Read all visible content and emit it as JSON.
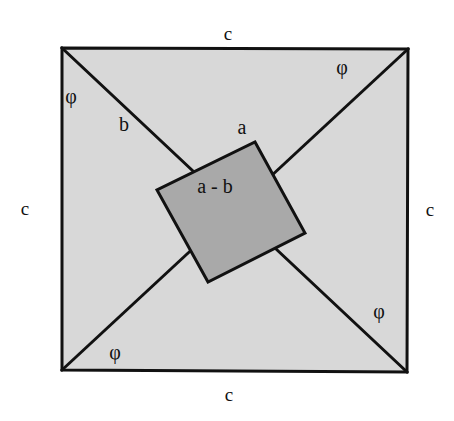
{
  "figure": {
    "type": "geometric-proof-diagram",
    "canvas": {
      "width": 454,
      "height": 421
    },
    "colors": {
      "page_background": "#ffffff",
      "outer_square_fill": "#d8d8d8",
      "inner_square_fill": "#a9a9a9",
      "stroke": "#111111",
      "text": "#111111"
    },
    "outer_square": {
      "name": "outer-square",
      "fill": "#d8d8d8",
      "stroke_width": 3,
      "points": [
        {
          "x": 62,
          "y": 48
        },
        {
          "x": 408,
          "y": 49
        },
        {
          "x": 407,
          "y": 372
        },
        {
          "x": 62,
          "y": 370
        }
      ]
    },
    "inner_square": {
      "name": "inner-square",
      "fill": "#a9a9a9",
      "stroke_width": 3,
      "points": [
        {
          "x": 255,
          "y": 142
        },
        {
          "x": 305,
          "y": 233
        },
        {
          "x": 208,
          "y": 282
        },
        {
          "x": 157,
          "y": 190
        }
      ]
    },
    "diagonals": [
      {
        "name": "diagonal-top-left-to-bottom-right",
        "x1": 62,
        "y1": 48,
        "x2": 407,
        "y2": 372,
        "stroke_width": 3
      },
      {
        "name": "diagonal-bottom-left-to-top-right",
        "x1": 62,
        "y1": 370,
        "x2": 408,
        "y2": 49,
        "stroke_width": 3
      }
    ]
  },
  "labels": {
    "sides": [
      {
        "id": "c-top",
        "text": "c",
        "x": 228,
        "y": 33,
        "name": "side-label-c-top"
      },
      {
        "id": "c-right",
        "text": "c",
        "x": 430,
        "y": 209,
        "name": "side-label-c-right"
      },
      {
        "id": "c-bottom",
        "text": "c",
        "x": 229,
        "y": 394,
        "name": "side-label-c-bottom"
      },
      {
        "id": "c-left",
        "text": "c",
        "x": 25,
        "y": 208,
        "name": "side-label-c-left"
      }
    ],
    "angles": [
      {
        "id": "phi-top-left",
        "text": "φ",
        "x": 71,
        "y": 96,
        "name": "angle-label-phi-top-left"
      },
      {
        "id": "phi-top-right",
        "text": "φ",
        "x": 342,
        "y": 67,
        "name": "angle-label-phi-top-right"
      },
      {
        "id": "phi-bottom-right",
        "text": "φ",
        "x": 379,
        "y": 311,
        "name": "angle-label-phi-bottom-right"
      },
      {
        "id": "phi-bottom-left",
        "text": "φ",
        "x": 115,
        "y": 352,
        "name": "angle-label-phi-bottom-left"
      }
    ],
    "segments": [
      {
        "id": "seg-b",
        "text": "b",
        "x": 124,
        "y": 124,
        "name": "segment-label-b"
      },
      {
        "id": "seg-a",
        "text": "a",
        "x": 242,
        "y": 127,
        "name": "segment-label-a"
      }
    ],
    "inner": [
      {
        "id": "inner-side",
        "text": "a - b",
        "x": 215,
        "y": 186,
        "name": "inner-square-label-a-minus-b"
      }
    ]
  },
  "chart_data": {
    "type": "diagram",
    "title": "",
    "shapes": [
      {
        "shape": "square",
        "role": "outer",
        "side_label": "c",
        "vertices": [
          [
            62,
            48
          ],
          [
            408,
            49
          ],
          [
            407,
            372
          ],
          [
            62,
            370
          ]
        ],
        "fill": "#d8d8d8"
      },
      {
        "shape": "square",
        "role": "inner",
        "side_label": "a - b",
        "vertices": [
          [
            255,
            142
          ],
          [
            305,
            233
          ],
          [
            208,
            282
          ],
          [
            157,
            190
          ]
        ],
        "fill": "#a9a9a9"
      }
    ],
    "lines": [
      {
        "role": "diagonal",
        "from": [
          62,
          48
        ],
        "to": [
          407,
          372
        ]
      },
      {
        "role": "diagonal",
        "from": [
          62,
          370
        ],
        "to": [
          408,
          49
        ]
      }
    ],
    "annotations": [
      {
        "text": "c",
        "position": [
          228,
          33
        ]
      },
      {
        "text": "c",
        "position": [
          430,
          209
        ]
      },
      {
        "text": "c",
        "position": [
          229,
          394
        ]
      },
      {
        "text": "c",
        "position": [
          25,
          208
        ]
      },
      {
        "text": "φ",
        "position": [
          71,
          96
        ]
      },
      {
        "text": "φ",
        "position": [
          342,
          67
        ]
      },
      {
        "text": "φ",
        "position": [
          379,
          311
        ]
      },
      {
        "text": "φ",
        "position": [
          115,
          352
        ]
      },
      {
        "text": "b",
        "position": [
          124,
          124
        ]
      },
      {
        "text": "a",
        "position": [
          242,
          127
        ]
      },
      {
        "text": "a - b",
        "position": [
          215,
          186
        ]
      }
    ]
  }
}
